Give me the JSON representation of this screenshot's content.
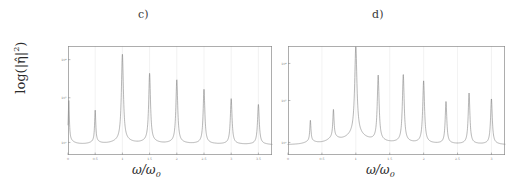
{
  "figure": {
    "panels": [
      {
        "id": "c",
        "label": "c)",
        "xlabel_main": "ω/ω",
        "xlabel_sub": "0",
        "ylabel_text": "log(|η̂|",
        "ylabel_sup": "2",
        "ylabel_close": ")"
      },
      {
        "id": "d",
        "label": "d)",
        "xlabel_main": "ω/ω",
        "xlabel_sub": "0"
      }
    ],
    "colors": {
      "curve": "#7a7a7a",
      "frame": "#8b8b8b",
      "grid": "#dedede",
      "text": "#2a2a2a",
      "background": "#ffffff"
    }
  },
  "chart_data": [
    {
      "type": "line",
      "id": "panel-c",
      "title": "c)",
      "xlabel": "ω/ω₀",
      "ylabel": "log(|η̂|²)",
      "xlim": [
        0,
        3.75
      ],
      "ylim": [
        0,
        1
      ],
      "yscale": "log",
      "grid": true,
      "legend": null,
      "xticks": [
        0,
        0.5,
        1,
        1.5,
        2,
        2.5,
        3,
        3.5
      ],
      "xticklabels": [
        "0",
        "0.5",
        "1",
        "1.5",
        "2",
        "2.5",
        "3",
        "3.5"
      ],
      "yticks": [
        0.115,
        0.525,
        0.875
      ],
      "yticklabels": [
        "10⁰",
        "10²",
        "10⁴"
      ],
      "baseline": 0.09,
      "peaks": [
        {
          "x": 0.015,
          "height": 0.46,
          "width": 0.012,
          "base": 0.16
        },
        {
          "x": 0.5,
          "height": 0.38,
          "width": 0.013,
          "base": 0.13
        },
        {
          "x": 1.0,
          "height": 0.88,
          "width": 0.022,
          "base": 0.16
        },
        {
          "x": 1.5,
          "height": 0.71,
          "width": 0.02,
          "base": 0.14
        },
        {
          "x": 2.0,
          "height": 0.66,
          "width": 0.02,
          "base": 0.13
        },
        {
          "x": 2.5,
          "height": 0.58,
          "width": 0.019,
          "base": 0.12
        },
        {
          "x": 3.0,
          "height": 0.5,
          "width": 0.019,
          "base": 0.11
        },
        {
          "x": 3.5,
          "height": 0.45,
          "width": 0.019,
          "base": 0.11
        }
      ]
    },
    {
      "type": "line",
      "id": "panel-d",
      "title": "d)",
      "xlabel": "ω/ω₀",
      "ylabel": "log(|η̂|²)",
      "xlim": [
        0,
        3.2
      ],
      "ylim": [
        0,
        1
      ],
      "yscale": "log",
      "grid": true,
      "legend": null,
      "xticks": [
        0,
        0.5,
        1,
        1.5,
        2,
        2.5,
        3
      ],
      "xticklabels": [
        "0",
        "0.5",
        "1",
        "1.5",
        "2",
        "2.5",
        "3"
      ],
      "yticks": [
        0.115,
        0.5,
        0.84
      ],
      "yticklabels": [
        "10⁰",
        "10²",
        "10⁴"
      ],
      "baseline": 0.09,
      "peaks": [
        {
          "x": 0.33,
          "height": 0.28,
          "width": 0.01,
          "base": 0.14
        },
        {
          "x": 0.67,
          "height": 0.34,
          "width": 0.011,
          "base": 0.18
        },
        {
          "x": 1.0,
          "height": 0.89,
          "width": 0.02,
          "base": 0.26
        },
        {
          "x": 1.33,
          "height": 0.68,
          "width": 0.016,
          "base": 0.13
        },
        {
          "x": 1.7,
          "height": 0.7,
          "width": 0.016,
          "base": 0.13
        },
        {
          "x": 2.0,
          "height": 0.65,
          "width": 0.016,
          "base": 0.12
        },
        {
          "x": 2.33,
          "height": 0.47,
          "width": 0.014,
          "base": 0.11
        },
        {
          "x": 2.67,
          "height": 0.55,
          "width": 0.015,
          "base": 0.11
        },
        {
          "x": 3.0,
          "height": 0.5,
          "width": 0.015,
          "base": 0.11
        }
      ]
    }
  ]
}
